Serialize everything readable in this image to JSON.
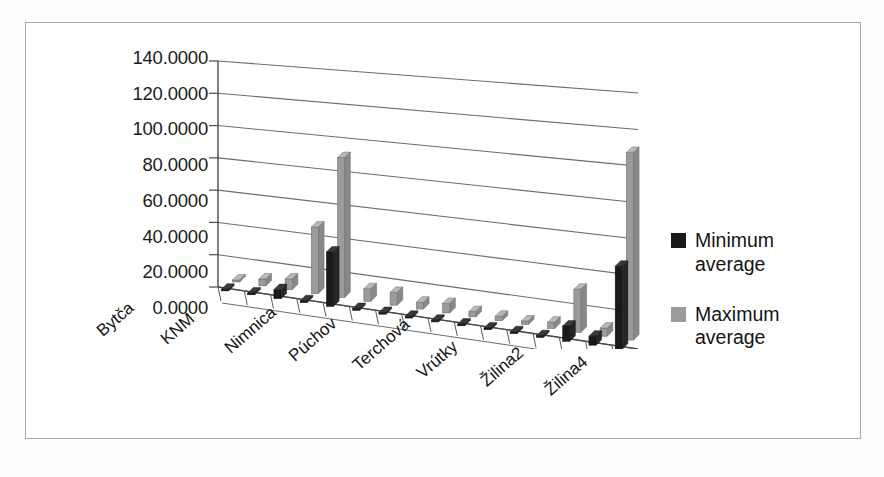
{
  "chart_data": {
    "type": "bar",
    "title": "",
    "xlabel": "",
    "ylabel": "",
    "ylim": [
      0,
      140
    ],
    "yticks": [
      "0.0000",
      "20.0000",
      "40.0000",
      "60.0000",
      "80.0000",
      "100.0000",
      "120.0000",
      "140.0000"
    ],
    "ytick_values": [
      0,
      20,
      40,
      60,
      80,
      100,
      120,
      140
    ],
    "grid": true,
    "legend_position": "right",
    "three_d": true,
    "categories": [
      "Bytča",
      "",
      "KNM",
      "",
      "Nimnica",
      "",
      "Púchov",
      "",
      "Terchová",
      "",
      "Vrútky",
      "",
      "Žilina2",
      "",
      "Žilina4",
      ""
    ],
    "visible_category_labels": [
      "Bytča",
      "KNM",
      "Nimnica",
      "Púchov",
      "Terchová",
      "Vrútky",
      "Žilina2",
      "Žilina4"
    ],
    "series": [
      {
        "name": "Minimum average",
        "color": "#1a1a1a",
        "values": [
          0.6,
          0.4,
          5.5,
          1.0,
          32.5,
          0.8,
          0.7,
          0.6,
          0.7,
          0.5,
          0.5,
          0.4,
          0.5,
          8.5,
          5.0,
          45.5
        ]
      },
      {
        "name": "Maximum average",
        "color": "#9b9b9b",
        "values": [
          1.2,
          4.2,
          6.5,
          40.0,
          83.5,
          7.5,
          7.5,
          4.0,
          5.5,
          3.0,
          2.5,
          2.0,
          3.5,
          24.0,
          4.5,
          103.0
        ]
      }
    ]
  },
  "legend": {
    "items": [
      {
        "label": "Minimum average",
        "color": "#1a1a1a"
      },
      {
        "label": "Maximum average",
        "color": "#9b9b9b"
      }
    ]
  }
}
